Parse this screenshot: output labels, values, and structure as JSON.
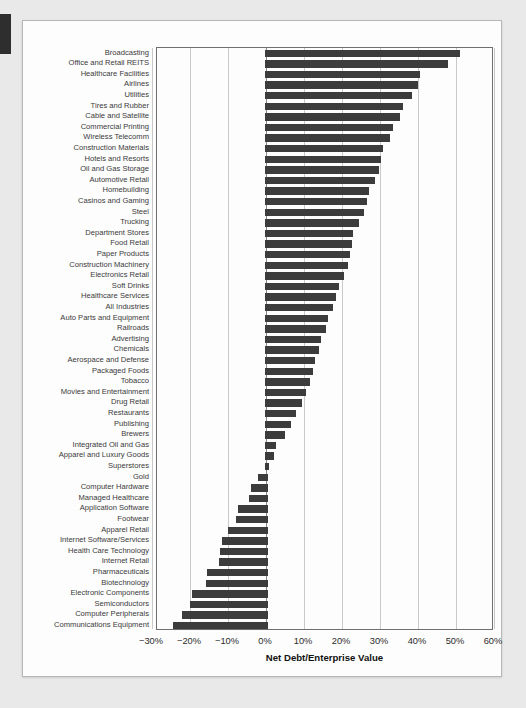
{
  "page": {
    "background": "#e9e9e9",
    "card_background": "#fdfdfd",
    "bar_color": "#3c3c3c",
    "grid_color": "#c9c9c9",
    "zero_line_color": "#8a8a8a"
  },
  "chart_data": {
    "type": "bar",
    "orientation": "horizontal",
    "title": "",
    "xlabel": "Net Debt/Enterprise Value",
    "ylabel": "",
    "xlim": [
      -28.7,
      60.0
    ],
    "grid": true,
    "legend": null,
    "xticks": [
      -30,
      -20,
      -10,
      0,
      10,
      20,
      30,
      40,
      50,
      60
    ],
    "xtick_labels": [
      "−30%",
      "−20%",
      "−10%",
      "0%",
      "10%",
      "20%",
      "30%",
      "40%",
      "50%",
      "60%"
    ],
    "categories": [
      "Broadcasting",
      "Office and Retail REITS",
      "Healthcare Facilities",
      "Airlines",
      "Utilities",
      "Tires and Rubber",
      "Cable and Satellite",
      "Commercial Printing",
      "Wireless Telecomm",
      "Construction Materials",
      "Hotels and Resorts",
      "Oil and Gas Storage",
      "Automotive Retail",
      "Homebuilding",
      "Casinos and Gaming",
      "Steel",
      "Trucking",
      "Department Stores",
      "Food Retail",
      "Paper Products",
      "Construction Machinery",
      "Electronics Retail",
      "Soft Drinks",
      "Healthcare Services",
      "All Industries",
      "Auto Parts and Equipment",
      "Railroads",
      "Advertising",
      "Chemicals",
      "Aerospace and Defense",
      "Packaged Foods",
      "Tobacco",
      "Movies and Entertainment",
      "Drug Retail",
      "Restaurants",
      "Publishing",
      "Brewers",
      "Integrated Oil and Gas",
      "Apparel and Luxury Goods",
      "Superstores",
      "Gold",
      "Computer Hardware",
      "Managed Healthcare",
      "Application Software",
      "Footwear",
      "Apparel Retail",
      "Internet Software/Services",
      "Health Care Technology",
      "Internet Retail",
      "Pharmaceuticals",
      "Biotechnology",
      "Electronic Components",
      "Semiconductors",
      "Computer Peripherals",
      "Communications Equipment"
    ],
    "values": [
      51.0,
      48.0,
      40.5,
      40.0,
      38.5,
      36.0,
      35.3,
      33.5,
      32.5,
      30.7,
      30.3,
      29.8,
      28.8,
      27.0,
      26.5,
      25.8,
      24.5,
      23.0,
      22.5,
      22.0,
      21.5,
      20.5,
      19.3,
      18.3,
      17.5,
      16.3,
      15.8,
      14.5,
      14.0,
      13.0,
      12.3,
      11.5,
      10.5,
      9.5,
      8.0,
      6.5,
      5.0,
      2.5,
      2.0,
      0.8,
      -2.0,
      -4.0,
      -4.5,
      -7.5,
      -8.0,
      -10.0,
      -11.5,
      -12.0,
      -12.5,
      -15.5,
      -15.8,
      -19.5,
      -20.0,
      -22.0,
      -24.5
    ]
  }
}
